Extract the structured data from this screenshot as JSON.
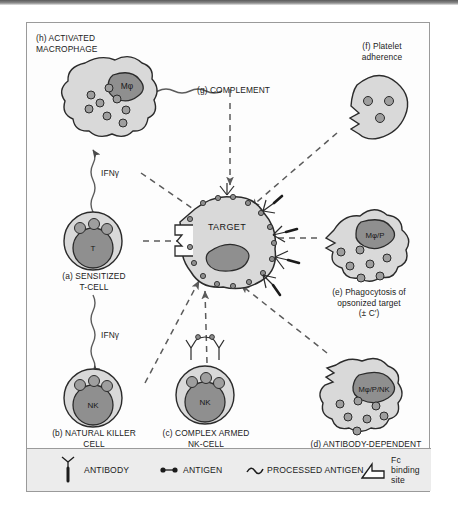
{
  "figure": {
    "title_present": false,
    "colors": {
      "cell_fill": "#d9d9d9",
      "nucleus_fill": "#8f8f8f",
      "granule_fill": "#9e9e9e",
      "outline": "#2b2b2b",
      "legend_band": "#ececec",
      "border": "#9a9a9a",
      "page_background": "#ffffff"
    },
    "cells": [
      {
        "id": "h",
        "key": "(h)",
        "label": "(h) ACTIVATED\nMACROPHAGE",
        "nucleus_label": "Mφ",
        "shape": "amoeboid",
        "granules": 8
      },
      {
        "id": "a",
        "key": "(a)",
        "label": "(a) SENSITIZED\nT-CELL",
        "nucleus_label": "T",
        "shape": "round",
        "granules": 3
      },
      {
        "id": "b",
        "key": "(b)",
        "label": "(b) NATURAL KILLER\nCELL",
        "nucleus_label": "NK",
        "shape": "round",
        "granules": 3
      },
      {
        "id": "c",
        "key": "(c)",
        "label": "(c) COMPLEX ARMED\nNK-CELL",
        "nucleus_label": "NK",
        "shape": "round",
        "granules": 3,
        "has_antibody_complex": true
      },
      {
        "id": "d",
        "key": "(d)",
        "label": "(d) ANTIBODY-DEPENDENT\nCELLULAR\nCYTOTOXICITY",
        "nucleus_label": "Mφ/P/NK",
        "shape": "amoeboid",
        "granules": 7,
        "has_fc_notch": true
      },
      {
        "id": "e",
        "key": "(e)",
        "label": "(e) Phagocytosis of\nopsonized target\n(± C′)",
        "nucleus_label": "Mφ/P",
        "shape": "amoeboid",
        "granules": 7,
        "has_fc_notch": true
      },
      {
        "id": "f",
        "key": "(f)",
        "label": "(f) Platelet\nadherence",
        "nucleus_label": "",
        "shape": "platelet",
        "granules": 3,
        "has_fc_notch": true
      }
    ],
    "target": {
      "label": "TARGET",
      "shape": "irregular-polygon",
      "has_nucleus": true,
      "surface_antigens": true,
      "bound_antibodies": true,
      "fc_binding_site": true
    },
    "complement": {
      "key": "(g)",
      "label": "(g) COMPLEMENT"
    },
    "cytokines": [
      {
        "label": "IFNγ",
        "from": "(a)",
        "to": "(h)"
      },
      {
        "label": "IFNγ",
        "from": "(a)",
        "to": "(b)"
      }
    ],
    "arrows": [
      {
        "from": "(a)",
        "to": "target",
        "style": "dashed"
      },
      {
        "from": "(h)",
        "to": "target",
        "style": "dashed"
      },
      {
        "from": "(b)",
        "to": "target",
        "style": "dashed"
      },
      {
        "from": "(c)",
        "to": "target",
        "style": "dashed"
      },
      {
        "from": "(d)",
        "to": "target",
        "style": "dashed"
      },
      {
        "from": "(e)",
        "to": "target",
        "style": "dashed"
      },
      {
        "from": "(f)",
        "to": "target",
        "style": "dashed"
      },
      {
        "from": "(g)",
        "to": "target",
        "style": "dashed"
      },
      {
        "from": "(g)",
        "to": "(h)",
        "style": "wavy"
      }
    ]
  },
  "legend": {
    "items": [
      {
        "glyph": "antibody-icon",
        "label": "ANTIBODY"
      },
      {
        "glyph": "antigen-icon",
        "label": "ANTIGEN"
      },
      {
        "glyph": "processed-antigen-icon",
        "label": "PROCESSED ANTIGEN"
      },
      {
        "glyph": "fc-binding-site-icon",
        "label": "Fc binding site"
      }
    ]
  }
}
